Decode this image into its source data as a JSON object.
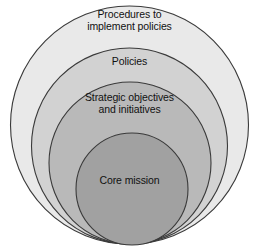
{
  "diagram": {
    "type": "concentric-circles",
    "background_color": "#ffffff",
    "outline_color": "#3a3a3a",
    "text_color": "#111111",
    "rings": [
      {
        "id": "ring-1",
        "level": 1,
        "label": "Procedures to\nimplement policies",
        "fill": "#e9e9e9",
        "cx": 129.5,
        "cy": 125,
        "r": 119
      },
      {
        "id": "ring-2",
        "level": 2,
        "label": "Policies",
        "fill": "#d2d2d2",
        "cx": 129.5,
        "cy": 146,
        "r": 98
      },
      {
        "id": "ring-3",
        "level": 3,
        "label": "Strategic objectives\nand initiatives",
        "fill": "#b9b9b9",
        "cx": 130,
        "cy": 163,
        "r": 81
      },
      {
        "id": "ring-4",
        "level": 4,
        "label": "Core mission",
        "fill": "#a1a1a1",
        "cx": 132,
        "cy": 189,
        "r": 56
      }
    ]
  }
}
